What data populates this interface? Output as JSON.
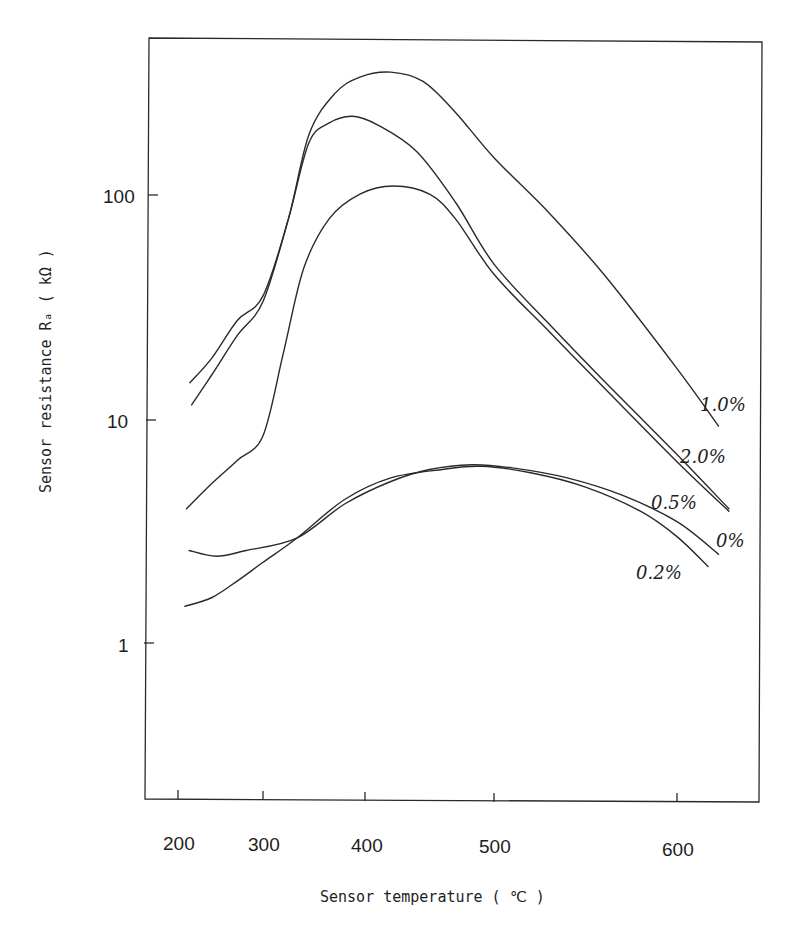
{
  "chart_data": {
    "type": "line",
    "title": "",
    "xlabel": "Sensor temperature ( ℃ )",
    "ylabel": "Sensor resistance Ra ( kΩ )",
    "yscale": "log",
    "ylim": [
      0.2,
      500
    ],
    "xlim": [
      175,
      640
    ],
    "x_ticks": [
      200,
      300,
      400,
      500,
      600
    ],
    "y_ticks": [
      {
        "value": 1,
        "label": "1"
      },
      {
        "value": 10,
        "label": "10"
      },
      {
        "value": 100,
        "label": "100"
      }
    ],
    "grid": false,
    "legend": "inline labels at right end of each curve",
    "series": [
      {
        "name": "1.0%",
        "points": [
          [
            214,
            14.7
          ],
          [
            240,
            19
          ],
          [
            270,
            28
          ],
          [
            300,
            36
          ],
          [
            325,
            80
          ],
          [
            345,
            190
          ],
          [
            370,
            290
          ],
          [
            395,
            345
          ],
          [
            420,
            363
          ],
          [
            445,
            330
          ],
          [
            470,
            240
          ],
          [
            500,
            150
          ],
          [
            530,
            85
          ],
          [
            560,
            45
          ],
          [
            600,
            17
          ],
          [
            620,
            9.4
          ]
        ]
      },
      {
        "name": "2.0%",
        "points": [
          [
            216,
            11.7
          ],
          [
            240,
            16
          ],
          [
            270,
            24
          ],
          [
            300,
            34
          ],
          [
            325,
            80
          ],
          [
            345,
            175
          ],
          [
            365,
            215
          ],
          [
            388,
            230
          ],
          [
            410,
            210
          ],
          [
            440,
            160
          ],
          [
            470,
            95
          ],
          [
            500,
            50
          ],
          [
            530,
            27
          ],
          [
            560,
            15
          ],
          [
            600,
            7
          ],
          [
            625,
            4.0
          ]
        ]
      },
      {
        "name": "0.5%",
        "points": [
          [
            210,
            4.0
          ],
          [
            240,
            5.2
          ],
          [
            270,
            6.6
          ],
          [
            300,
            8.5
          ],
          [
            320,
            20
          ],
          [
            340,
            48
          ],
          [
            365,
            80
          ],
          [
            395,
            103
          ],
          [
            422,
            112
          ],
          [
            450,
            103
          ],
          [
            470,
            80
          ],
          [
            500,
            45
          ],
          [
            530,
            25
          ],
          [
            560,
            14
          ],
          [
            600,
            6.5
          ],
          [
            625,
            3.9
          ]
        ]
      },
      {
        "name": "0%",
        "points": [
          [
            213,
            2.6
          ],
          [
            245,
            2.45
          ],
          [
            280,
            2.6
          ],
          [
            333,
            2.95
          ],
          [
            380,
            4.2
          ],
          [
            420,
            5.3
          ],
          [
            450,
            6.0
          ],
          [
            483,
            6.3
          ],
          [
            510,
            6.1
          ],
          [
            540,
            5.5
          ],
          [
            570,
            4.6
          ],
          [
            600,
            3.5
          ],
          [
            620,
            2.5
          ]
        ]
      },
      {
        "name": "0.2%",
        "points": [
          [
            208,
            1.46
          ],
          [
            240,
            1.6
          ],
          [
            270,
            1.9
          ],
          [
            300,
            2.3
          ],
          [
            333,
            2.95
          ],
          [
            380,
            4.4
          ],
          [
            420,
            5.5
          ],
          [
            460,
            6.0
          ],
          [
            490,
            6.2
          ],
          [
            520,
            5.8
          ],
          [
            550,
            5.0
          ],
          [
            580,
            3.9
          ],
          [
            600,
            3.0
          ],
          [
            615,
            2.2
          ]
        ]
      }
    ]
  },
  "labels": {
    "x_axis_title": "Sensor temperature ( ℃ )",
    "y_axis_title": "Sensor resistance Rₐ ( kΩ )",
    "series": {
      "s1_0": "1.0%",
      "s2_0": "2.0%",
      "s0_5": "0.5%",
      "s0": "0%",
      "s0_2": "0.2%"
    },
    "x_ticks": {
      "t200": "200",
      "t300": "300",
      "t400": "400",
      "t500": "500",
      "t600": "600"
    },
    "y_ticks": {
      "t1": "1",
      "t10": "10",
      "t100": "100"
    }
  }
}
